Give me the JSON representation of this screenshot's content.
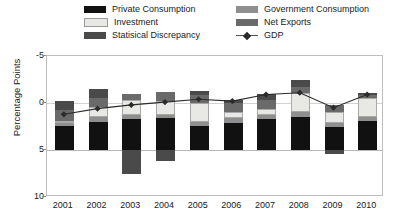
{
  "legend": {
    "items": [
      {
        "label": "Private Consumption",
        "icon": "square-swatch-icon",
        "color": "#111111",
        "type": "swatch",
        "col": 0,
        "row": 0
      },
      {
        "label": "Investment",
        "icon": "square-swatch-icon",
        "color": "#e8e8e4",
        "type": "swatch",
        "col": 0,
        "row": 1
      },
      {
        "label": "Statisical Discrepancy",
        "icon": "square-swatch-icon",
        "color": "#4a4a4a",
        "type": "swatch",
        "col": 0,
        "row": 2
      },
      {
        "label": "Government Consumption",
        "icon": "square-swatch-icon",
        "color": "#8f8f8f",
        "type": "swatch",
        "col": 1,
        "row": 0
      },
      {
        "label": "Net Exports",
        "icon": "square-swatch-icon",
        "color": "#6a6a6a",
        "type": "swatch",
        "col": 1,
        "row": 1
      },
      {
        "label": "GDP",
        "icon": "line-diamond-marker-icon",
        "color": "#2b2b2b",
        "type": "line",
        "col": 1,
        "row": 2
      }
    ]
  },
  "axis": {
    "y_label": "Percentage Points",
    "y_ticks": [
      "10",
      "5",
      "0",
      "-5"
    ],
    "x_ticks": [
      "2001",
      "2002",
      "2003",
      "2004",
      "2005",
      "2006",
      "2007",
      "2008",
      "2009",
      "2010"
    ]
  },
  "chart_data": {
    "type": "bar",
    "title": "",
    "xlabel": "",
    "ylabel": "Percentage Points",
    "ylim": [
      -5,
      10
    ],
    "y_ticks": [
      -5,
      0,
      5,
      10
    ],
    "grid": true,
    "stacked": true,
    "legend_position": "top",
    "categories": [
      "2001",
      "2002",
      "2003",
      "2004",
      "2005",
      "2006",
      "2007",
      "2008",
      "2009",
      "2010"
    ],
    "series": [
      {
        "name": "Private Consumption",
        "color": "#111111",
        "values": [
          2.6,
          3.0,
          3.3,
          3.4,
          2.6,
          2.9,
          3.3,
          3.5,
          2.4,
          3.1
        ]
      },
      {
        "name": "Government Consumption",
        "color": "#8f8f8f",
        "values": [
          0.4,
          0.5,
          0.4,
          0.3,
          0.4,
          0.5,
          0.4,
          0.5,
          0.5,
          0.4
        ]
      },
      {
        "name": "Investment",
        "color": "#e8e8e4",
        "values": [
          0.1,
          1.1,
          1.6,
          1.5,
          2.0,
          0.6,
          0.7,
          2.1,
          1.1,
          2.0
        ]
      },
      {
        "name": "Net Exports",
        "color": "#6a6a6a",
        "values": [
          1.2,
          0.9,
          0.7,
          1.0,
          0.8,
          1.0,
          0.9,
          0.6,
          0.8,
          0.5
        ]
      },
      {
        "name": "Statisical Discrepancy",
        "color": "#4a4a4a",
        "values": [
          0.9,
          1.0,
          -2.6,
          -1.2,
          0.5,
          0.3,
          0.7,
          0.7,
          -0.4,
          0.1
        ]
      }
    ],
    "line_series": {
      "name": "GDP",
      "color": "#2b2b2b",
      "marker": "diamond",
      "values": [
        3.8,
        4.4,
        4.8,
        5.1,
        5.4,
        5.2,
        5.9,
        6.1,
        4.5,
        5.9
      ]
    }
  }
}
